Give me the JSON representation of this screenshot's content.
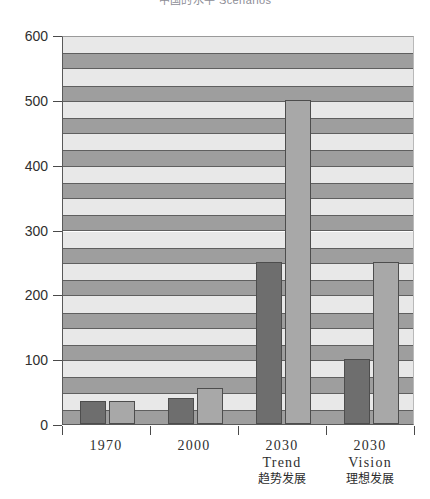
{
  "title": {
    "cropped_text": "中国的水平 Scenarios"
  },
  "chart_data": {
    "type": "bar",
    "title": "",
    "xlabel": "",
    "ylabel": "",
    "ylim": [
      0,
      600
    ],
    "yticks": [
      0,
      100,
      200,
      300,
      400,
      500,
      600
    ],
    "ytick_labels": [
      "0",
      "100",
      "200",
      "300",
      "400",
      "500",
      "600"
    ],
    "grid": "horizontal-bands",
    "band_interval": 25,
    "legend": "none",
    "categories": [
      {
        "line1": "1970",
        "line2": "",
        "line3": ""
      },
      {
        "line1": "2000",
        "line2": "",
        "line3": ""
      },
      {
        "line1": "2030",
        "line2": "Trend",
        "line3": "趋势发展"
      },
      {
        "line1": "2030",
        "line2": "Vision",
        "line3": "理想发展"
      }
    ],
    "series": [
      {
        "name": "dark",
        "color": "#6e6e6e",
        "values": [
          35,
          40,
          250,
          100
        ]
      },
      {
        "name": "light",
        "color": "#a8a8a8",
        "values": [
          35,
          55,
          500,
          250
        ]
      }
    ],
    "colors": {
      "band_dark": "#9e9e9e",
      "band_light": "#e8e8e8",
      "axis": "#4a4a4a",
      "bar_dark": "#6e6e6e",
      "bar_light": "#a8a8a8",
      "background": "#ffffff"
    }
  }
}
